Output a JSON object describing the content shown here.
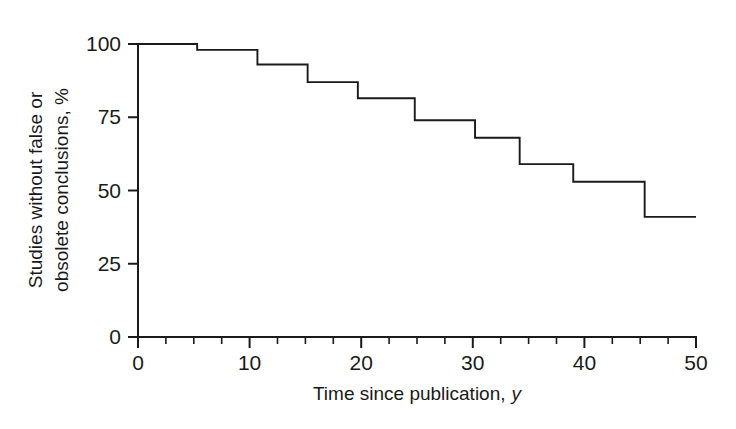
{
  "chart_data": {
    "type": "line",
    "title": "",
    "subtitle": "",
    "xlabel": "Time since publication, y",
    "xlabel_main": "Time since publication,",
    "xlabel_symbol": "y",
    "ylabel": "Studies without false or obsolete conclusions, %",
    "ylabel_line1": "Studies without false or",
    "ylabel_line2": "obsolete conclusions, %",
    "xlim": [
      0,
      50
    ],
    "ylim": [
      0,
      100
    ],
    "grid": false,
    "legend": "none",
    "line_style": "step-post",
    "x_ticks": [
      0,
      10,
      20,
      30,
      40,
      50
    ],
    "x_tick_labels": [
      "0",
      "10",
      "20",
      "30",
      "40",
      "50"
    ],
    "x_minor_tick_step": 2.5,
    "y_ticks": [
      0,
      25,
      50,
      75,
      100
    ],
    "y_tick_labels": [
      "0",
      "25",
      "50",
      "75",
      "100"
    ],
    "series": [
      {
        "name": "Studies without false or obsolete conclusions",
        "color": "#1a1a1a",
        "x": [
          0,
          5.3,
          10.7,
          15.2,
          19.7,
          24.8,
          30.2,
          34.2,
          39.0,
          45.4,
          50
        ],
        "values": [
          100,
          98,
          93,
          87,
          81.5,
          74,
          68,
          59,
          53,
          41,
          41
        ],
        "points": [
          {
            "x": 0,
            "y": 100
          },
          {
            "x": 5.3,
            "y": 98
          },
          {
            "x": 10.7,
            "y": 93
          },
          {
            "x": 15.2,
            "y": 87
          },
          {
            "x": 19.7,
            "y": 81.5
          },
          {
            "x": 24.8,
            "y": 74
          },
          {
            "x": 30.2,
            "y": 68
          },
          {
            "x": 34.2,
            "y": 59
          },
          {
            "x": 39.0,
            "y": 53
          },
          {
            "x": 45.4,
            "y": 41
          },
          {
            "x": 50,
            "y": 41
          }
        ]
      }
    ]
  },
  "layout": {
    "plot_left": 138,
    "plot_right": 696,
    "plot_top": 44,
    "plot_bottom": 337,
    "background": "#ffffff",
    "axis_color": "#1a1a1a"
  }
}
